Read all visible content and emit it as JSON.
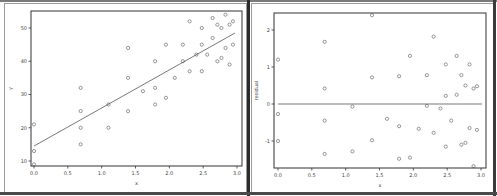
{
  "chart_data": [
    {
      "type": "scatter",
      "title": "",
      "xlabel": "x",
      "ylabel": "y",
      "xlim": [
        -0.05,
        3.05
      ],
      "ylim": [
        7,
        55
      ],
      "xticks": [
        0.0,
        0.5,
        1.0,
        1.5,
        2.0,
        2.5,
        3.0
      ],
      "xtick_labels": [
        "0.0",
        "0.5",
        "1.0",
        "1.5",
        "2.0",
        "2.5",
        "3.0"
      ],
      "yticks": [
        10,
        20,
        30,
        40,
        50
      ],
      "ytick_labels": [
        "10",
        "20",
        "30",
        "40",
        "50"
      ],
      "grid": false,
      "points": {
        "x": [
          0.0,
          0.0,
          0.0,
          0.69,
          0.69,
          0.69,
          0.69,
          1.1,
          1.1,
          1.39,
          1.39,
          1.39,
          1.61,
          1.79,
          1.79,
          1.79,
          1.95,
          1.95,
          2.08,
          2.2,
          2.2,
          2.3,
          2.3,
          2.4,
          2.48,
          2.48,
          2.48,
          2.56,
          2.64,
          2.64,
          2.71,
          2.71,
          2.77,
          2.77,
          2.83,
          2.83,
          2.89,
          2.89,
          2.94,
          2.94
        ],
        "y": [
          21,
          13,
          9,
          32,
          25,
          20,
          15,
          27,
          20,
          44,
          35,
          25,
          31,
          40,
          32,
          27,
          45,
          29,
          35,
          45,
          40,
          52,
          37,
          42,
          50,
          45,
          37,
          42,
          53,
          47,
          51,
          40,
          50,
          41,
          54,
          44,
          51,
          39,
          52,
          45
        ]
      },
      "fit_line": {
        "x": [
          0.0,
          2.97
        ],
        "y": [
          14.5,
          48.5
        ]
      }
    },
    {
      "type": "scatter",
      "title": "",
      "xlabel": "x",
      "ylabel": "residual",
      "xlim": [
        -0.05,
        3.05
      ],
      "ylim": [
        -1.75,
        2.5
      ],
      "xticks": [
        0.0,
        0.5,
        1.0,
        1.5,
        2.0,
        2.5,
        3.0
      ],
      "xtick_labels": [
        "0.0",
        "0.5",
        "1.0",
        "1.5",
        "2.0",
        "2.5",
        "3.0"
      ],
      "yticks": [
        -1,
        0,
        1,
        2
      ],
      "ytick_labels": [
        "-1",
        "0",
        "1",
        "2"
      ],
      "grid": false,
      "points": {
        "x": [
          0.0,
          0.0,
          0.0,
          0.69,
          0.69,
          0.69,
          0.69,
          1.1,
          1.1,
          1.39,
          1.39,
          1.39,
          1.61,
          1.79,
          1.79,
          1.79,
          1.95,
          1.95,
          2.08,
          2.2,
          2.2,
          2.3,
          2.3,
          2.4,
          2.48,
          2.48,
          2.48,
          2.56,
          2.64,
          2.64,
          2.71,
          2.71,
          2.77,
          2.77,
          2.83,
          2.83,
          2.89,
          2.89,
          2.94,
          2.94
        ],
        "y": [
          1.2,
          -0.27,
          -1.0,
          1.68,
          0.42,
          -0.45,
          -1.35,
          -0.07,
          -1.28,
          2.4,
          0.72,
          -0.98,
          -0.4,
          0.75,
          -0.6,
          -1.48,
          1.3,
          -1.45,
          -0.67,
          0.78,
          -0.05,
          1.82,
          -0.78,
          -0.12,
          1.07,
          0.22,
          -1.15,
          -0.45,
          1.3,
          0.25,
          0.78,
          -1.1,
          0.5,
          -1.05,
          1.07,
          -0.65,
          0.42,
          -1.68,
          0.48,
          -0.7
        ]
      },
      "reference_line": {
        "y": 0
      }
    }
  ]
}
